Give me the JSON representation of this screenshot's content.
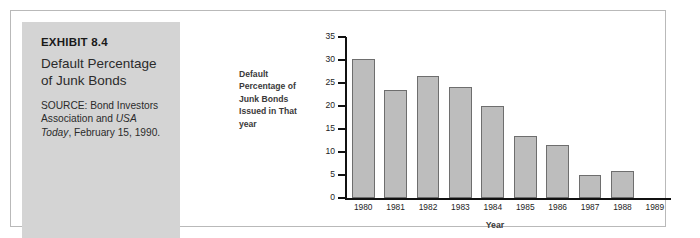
{
  "exhibit": {
    "label": "EXHIBIT 8.4",
    "title": "Default Percentage of Junk Bonds",
    "source_prefix": "SOURCE: Bond Investors Association and ",
    "source_italic": "USA Today",
    "source_suffix": ", February 15, 1990."
  },
  "chart_data": {
    "type": "bar",
    "title": "",
    "xlabel": "Year",
    "ylabel": "Default Percentage of Junk Bonds Issued in That year",
    "categories": [
      "1980",
      "1981",
      "1982",
      "1983",
      "1984",
      "1985",
      "1986",
      "1987",
      "1988",
      "1989"
    ],
    "values": [
      30.2,
      23.4,
      26.5,
      24.2,
      20.0,
      13.5,
      11.5,
      5.0,
      5.8,
      0
    ],
    "ylim": [
      0,
      35
    ],
    "ytick_values": [
      0,
      5,
      10,
      15,
      20,
      25,
      30,
      35
    ],
    "ytick_labels": [
      "0",
      "5",
      "10",
      "15",
      "20",
      "25",
      "30",
      "35"
    ],
    "grid": false,
    "legend": "none",
    "bar_fill_color": "#bdbdbd",
    "bar_edge_color": "#6e6e6e",
    "axis_color": "#111111"
  },
  "colors": {
    "caption_panel_bg": "#d4d4d4",
    "frame_border": "#b9b9b9",
    "page_bg": "#ffffff"
  }
}
